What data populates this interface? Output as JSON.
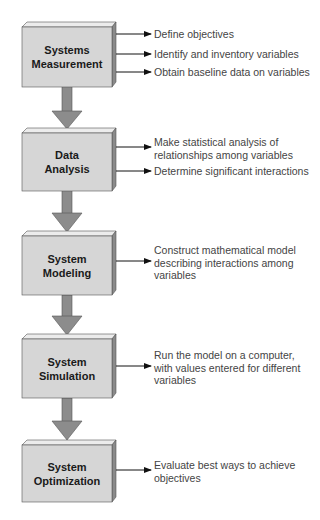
{
  "diagram": {
    "type": "flowchart",
    "colors": {
      "box_front": "#d6d6d6",
      "box_top": "#ececec",
      "box_side": "#8a8a8a",
      "box_border": "#555555",
      "flow_arrow": "#8c8c8c",
      "text_label": "#1a1a1a",
      "text_note": "#444444"
    },
    "stages": [
      {
        "label": "Systems Measurement",
        "label_lines": [
          "Systems",
          "Measurement"
        ],
        "outputs": [
          {
            "lines": [
              "Define objectives"
            ]
          },
          {
            "lines": [
              "Identify and inventory variables"
            ]
          },
          {
            "lines": [
              "Obtain baseline data on variables"
            ]
          }
        ]
      },
      {
        "label": "Data Analysis",
        "label_lines": [
          "Data",
          "Analysis"
        ],
        "outputs": [
          {
            "lines": [
              "Make statistical analysis of",
              "relationships among variables"
            ]
          },
          {
            "lines": [
              "Determine significant interactions"
            ]
          }
        ]
      },
      {
        "label": "System Modeling",
        "label_lines": [
          "System",
          "Modeling"
        ],
        "outputs": [
          {
            "lines": [
              "Construct mathematical model",
              "describing interactions among",
              "variables"
            ]
          }
        ]
      },
      {
        "label": "System Simulation",
        "label_lines": [
          "System",
          "Simulation"
        ],
        "outputs": [
          {
            "lines": [
              "Run the model on a computer,",
              "with values entered for different",
              "variables"
            ]
          }
        ]
      },
      {
        "label": "System Optimization",
        "label_lines": [
          "System",
          "Optimization"
        ],
        "outputs": [
          {
            "lines": [
              "Evaluate best ways to achieve",
              "objectives"
            ]
          }
        ]
      }
    ]
  }
}
